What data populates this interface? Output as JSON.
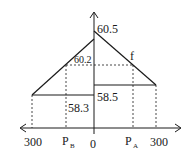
{
  "diagram": {
    "axis": {
      "y_peak_label": "60.5",
      "origin_label": "0",
      "left_end_label": "300",
      "right_end_label": "300"
    },
    "labels": {
      "left_peak": "60.2",
      "curve_f": "f",
      "left_base": "58.3",
      "right_base": "58.5",
      "p_b": "P",
      "p_b_sub": "B",
      "p_a": "P",
      "p_a_sub": "A"
    },
    "colors": {
      "line": "#1a1a1a",
      "background": "#ffffff"
    }
  }
}
